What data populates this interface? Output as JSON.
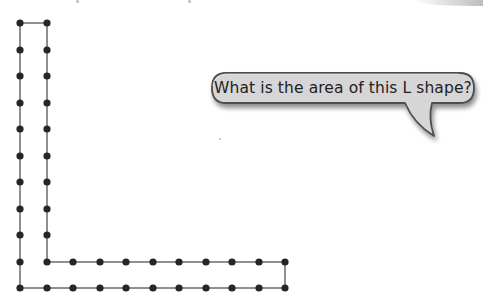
{
  "diagram": {
    "grid": {
      "unit_px": 26.5,
      "origin": [
        20,
        23
      ],
      "columns": 11,
      "rows": 11
    },
    "shape": {
      "name": "L shape",
      "vertices_grid": [
        [
          0,
          0
        ],
        [
          1,
          0
        ],
        [
          1,
          9
        ],
        [
          10,
          9
        ],
        [
          10,
          10
        ],
        [
          0,
          10
        ]
      ],
      "vertical_bar": {
        "width_units": 1,
        "height_units": 10
      },
      "horizontal_bar": {
        "width_units": 10,
        "height_units": 1
      },
      "area_units": 19
    },
    "colors": {
      "line": "#8f8f8f",
      "dot": "#262626",
      "bubble_fill": "#d6d6d6",
      "bubble_border": "#4d4d4d",
      "text": "#222222"
    }
  },
  "speech_bubble": {
    "text": "What is the area of this L shape?"
  }
}
